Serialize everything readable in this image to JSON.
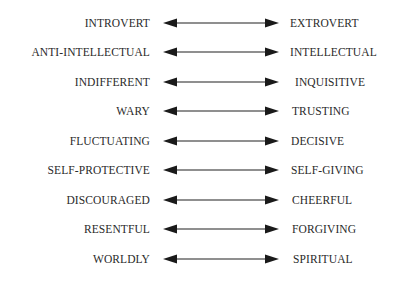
{
  "pairs": [
    {
      "left": "INTROVERT",
      "right": "EXTROVERT"
    },
    {
      "left": "ANTI-INTELLECTUAL",
      "right": "INTELLECTUAL"
    },
    {
      "left": "INDIFFERENT",
      "right": "INQUISITIVE"
    },
    {
      "left": "WARY",
      "right": "TRUSTING"
    },
    {
      "left": "FLUCTUATING",
      "right": "DECISIVE"
    },
    {
      "left": "SELF-PROTECTIVE",
      "right": "SELF-GIVING"
    },
    {
      "left": "DISCOURAGED",
      "right": "CHEERFUL"
    },
    {
      "left": "RESENTFUL",
      "right": "FORGIVING"
    },
    {
      "left": "WORLDLY",
      "right": "SPIRITUAL"
    }
  ],
  "colors": {
    "text": "#2a2a2a",
    "arrow": "#1a1a1a",
    "line": "#6a6a6a"
  }
}
